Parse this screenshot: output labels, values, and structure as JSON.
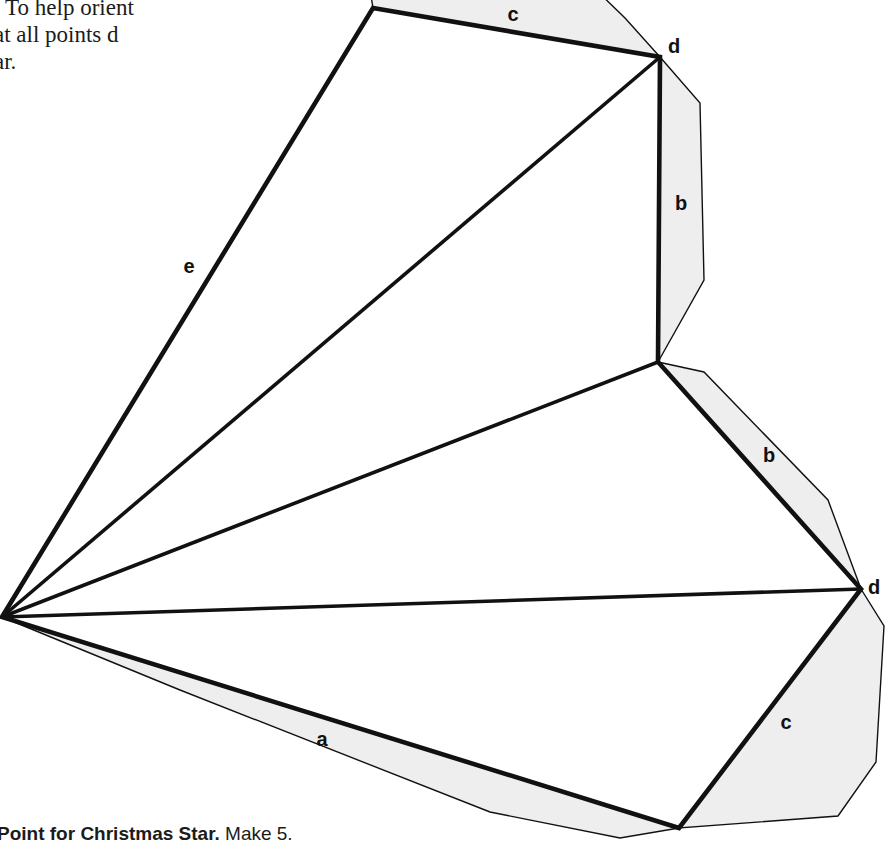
{
  "page": {
    "background_color": "#ffffff",
    "ink_color": "#111111",
    "seam_fill_color": "#eeeeee",
    "width": 885,
    "height": 849
  },
  "body_copy": {
    "lines": [
      ". To help orient",
      "at all points d",
      "ar."
    ]
  },
  "caption": {
    "title": "Point for Christmas Star.",
    "note": "Make 5."
  },
  "figure": {
    "name": "christmas-star-point-pattern-piece",
    "sew_line_path": "M 373 8 L 660 57 L 658 362 L 861 589 L 679 828 L 2 617 Z",
    "inner_lines": [
      {
        "name": "inner-line-to-top-d",
        "d": "M 2 617 L 660 57"
      },
      {
        "name": "inner-line-to-notch",
        "d": "M 2 617 L 658 362"
      },
      {
        "name": "inner-line-to-right-d",
        "d": "M 2 617 L 861 589"
      }
    ],
    "seam_allowances": [
      {
        "name": "seam-allowance-c-top",
        "d": "M 373 8 L 368 -22 L 592 -14 L 625 18 L 660 57 Z"
      },
      {
        "name": "seam-allowance-b-upper",
        "d": "M 660 57 L 700 103 L 704 280 L 658 362 Z"
      },
      {
        "name": "seam-allowance-b-lower",
        "d": "M 658 362 L 704 372 L 828 500 L 861 589 Z"
      },
      {
        "name": "seam-allowance-c-lower",
        "d": "M 861 589 L 884 626 L 876 762 L 838 816 L 679 828 Z"
      },
      {
        "name": "seam-allowance-a-bottom",
        "d": "M 679 828 L 620 838 L 490 812 L 180 690 L 2 617 Z"
      }
    ],
    "edge_labels": [
      {
        "name": "edge-label-c-top",
        "text": "c",
        "x": 513,
        "y": 16
      },
      {
        "name": "edge-label-b-upper",
        "text": "b",
        "x": 681,
        "y": 205
      },
      {
        "name": "edge-label-b-lower",
        "text": "b",
        "x": 769,
        "y": 457
      },
      {
        "name": "edge-label-c-lower",
        "text": "c",
        "x": 786,
        "y": 724
      },
      {
        "name": "edge-label-a-bottom",
        "text": "a",
        "x": 322,
        "y": 741
      },
      {
        "name": "edge-label-e-diagonal",
        "text": "e",
        "x": 189,
        "y": 268
      }
    ],
    "vertex_labels": [
      {
        "name": "vertex-label-d-top",
        "text": "d",
        "x": 668,
        "y": 48
      },
      {
        "name": "vertex-label-d-right",
        "text": "d",
        "x": 868,
        "y": 589
      }
    ]
  }
}
